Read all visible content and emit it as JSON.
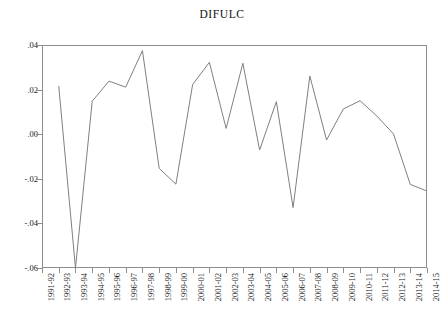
{
  "chart_data": {
    "type": "line",
    "title": "DIFULC",
    "xlabel": "",
    "ylabel": "",
    "ylim": [
      -0.06,
      0.04
    ],
    "yticks": [
      0.04,
      0.02,
      0.0,
      -0.02,
      -0.04,
      -0.06
    ],
    "ytick_labels": [
      ".04",
      ".02",
      ".00",
      "-.02",
      "-.04",
      "-.06"
    ],
    "grid": false,
    "legend": "none",
    "line_color": "#808080",
    "categories": [
      "1991-92",
      "1992-93",
      "1993-94",
      "1994-95",
      "1995-96",
      "1996-97",
      "1997-98",
      "1998-99",
      "1999-00",
      "2000-01",
      "2001-02",
      "2002-03",
      "2003-04",
      "2004-05",
      "2005-06",
      "2006-07",
      "2007-08",
      "2008-09",
      "2009-10",
      "2010-11",
      "2011-12",
      "2012-13",
      "2013-14",
      "2014-15"
    ],
    "series": [
      {
        "name": "DIFULC",
        "values": [
          null,
          0.0216,
          -0.06,
          0.0148,
          0.0238,
          0.0211,
          0.0375,
          -0.0153,
          -0.0224,
          0.0223,
          0.0322,
          0.0026,
          0.0318,
          -0.0071,
          0.0146,
          -0.0329,
          0.0261,
          -0.0026,
          0.0113,
          0.015,
          0.0082,
          0.0001,
          -0.0225,
          -0.0255
        ]
      }
    ]
  }
}
